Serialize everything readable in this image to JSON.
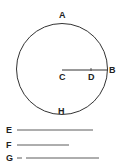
{
  "diagram": {
    "type": "geometry-circle",
    "colors": {
      "stroke": "#333333",
      "label": "#222222",
      "background": "#ffffff"
    },
    "circle": {
      "center_label": "C",
      "top_label": "A",
      "bottom_label": "H",
      "radius_end_label": "B",
      "radius_mid_label": "D"
    },
    "segments": [
      {
        "label": "E"
      },
      {
        "label": "F"
      },
      {
        "label": "G"
      }
    ]
  }
}
